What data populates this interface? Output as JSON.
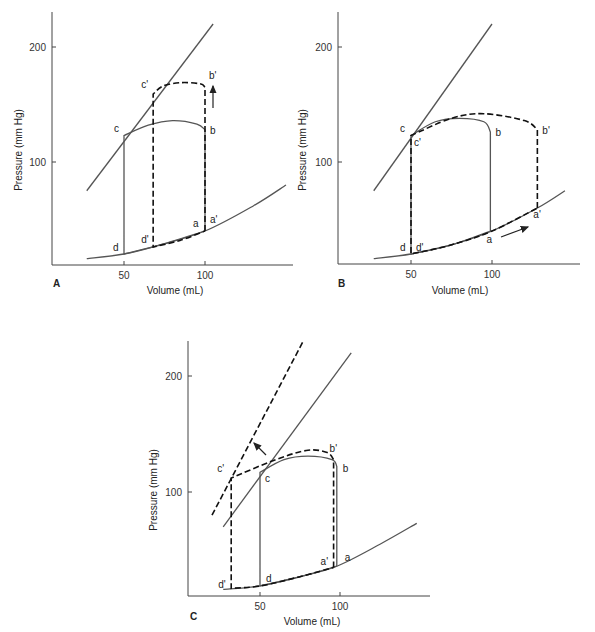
{
  "figure": {
    "x_axis_label": "Volume (mL)",
    "y_axis_label": "Pressure (mm Hg)"
  },
  "chart_data": [
    {
      "type": "line",
      "panel": "A",
      "title": "",
      "xlabel": "Volume (mL)",
      "ylabel": "Pressure (mm Hg)",
      "x_ticks": [
        50,
        100
      ],
      "y_ticks": [
        100,
        200
      ],
      "xlim": [
        10,
        155
      ],
      "ylim": [
        10,
        215
      ],
      "annotation": "upward arrow from b to b' (increased afterload)",
      "series": [
        {
          "name": "ESPVR",
          "style": "solid",
          "points": [
            [
              27,
              75
            ],
            [
              105,
              220
            ]
          ]
        },
        {
          "name": "EDPVR",
          "style": "solid",
          "points": [
            [
              27,
              16
            ],
            [
              50,
              20
            ],
            [
              70,
              27
            ],
            [
              100,
              40
            ],
            [
              130,
              62
            ],
            [
              150,
              80
            ]
          ]
        },
        {
          "name": "Control loop (a-b-c-d)",
          "style": "solid",
          "points": [
            [
              100,
              40
            ],
            [
              100,
              128
            ],
            [
              95,
              133
            ],
            [
              80,
              136
            ],
            [
              65,
              132
            ],
            [
              50,
              123
            ],
            [
              50,
              20
            ],
            [
              70,
              27
            ],
            [
              100,
              40
            ]
          ]
        },
        {
          "name": "Increased afterload loop (a'-b'-c'-d')",
          "style": "dashed",
          "points": [
            [
              100,
              40
            ],
            [
              100,
              165
            ],
            [
              97,
              168
            ],
            [
              85,
              169
            ],
            [
              74,
              166
            ],
            [
              68,
              159
            ],
            [
              68,
              26
            ],
            [
              85,
              32
            ],
            [
              100,
              40
            ]
          ]
        }
      ],
      "point_labels": {
        "a": [
          100,
          40
        ],
        "a'": [
          100,
          40
        ],
        "b": [
          100,
          128
        ],
        "b'": [
          100,
          165
        ],
        "c": [
          50,
          123
        ],
        "c'": [
          68,
          159
        ],
        "d": [
          50,
          20
        ],
        "d'": [
          68,
          26
        ]
      }
    },
    {
      "type": "line",
      "panel": "B",
      "title": "",
      "xlabel": "Volume (mL)",
      "ylabel": "Pressure (mm Hg)",
      "x_ticks": [
        50,
        100
      ],
      "y_ticks": [
        100,
        200
      ],
      "xlim": [
        10,
        155
      ],
      "ylim": [
        10,
        215
      ],
      "annotation": "arrow along EDPVR from a toward a' (increased preload)",
      "series": [
        {
          "name": "ESPVR",
          "style": "solid",
          "points": [
            [
              27,
              75
            ],
            [
              100,
              220
            ]
          ]
        },
        {
          "name": "EDPVR",
          "style": "solid",
          "points": [
            [
              27,
              16
            ],
            [
              50,
              20
            ],
            [
              75,
              28
            ],
            [
              100,
              40
            ],
            [
              128,
              60
            ],
            [
              145,
              75
            ]
          ]
        },
        {
          "name": "Control loop (a-b-c-d)",
          "style": "solid",
          "points": [
            [
              99,
              40
            ],
            [
              99,
              126
            ],
            [
              95,
              135
            ],
            [
              80,
              138
            ],
            [
              65,
              135
            ],
            [
              50,
              123
            ],
            [
              50,
              20
            ],
            [
              75,
              28
            ],
            [
              99,
              40
            ]
          ]
        },
        {
          "name": "Increased preload loop (a'-b'-c'-d')",
          "style": "dashed",
          "points": [
            [
              128,
              60
            ],
            [
              128,
              128
            ],
            [
              120,
              136
            ],
            [
              95,
              142
            ],
            [
              75,
              138
            ],
            [
              50,
              123
            ],
            [
              50,
              20
            ],
            [
              75,
              28
            ],
            [
              100,
              40
            ],
            [
              128,
              60
            ]
          ]
        }
      ],
      "point_labels": {
        "a": [
          99,
          40
        ],
        "a'": [
          128,
          60
        ],
        "b": [
          99,
          126
        ],
        "b'": [
          128,
          128
        ],
        "c": [
          50,
          123
        ],
        "c'": [
          50,
          123
        ],
        "d": [
          50,
          20
        ],
        "d'": [
          50,
          20
        ]
      }
    },
    {
      "type": "line",
      "panel": "C",
      "title": "",
      "xlabel": "Volume (mL)",
      "ylabel": "Pressure (mm Hg)",
      "x_ticks": [
        50,
        100
      ],
      "y_ticks": [
        100,
        200
      ],
      "xlim": [
        5,
        155
      ],
      "ylim": [
        10,
        230
      ],
      "annotation": "arrow pointing up-left from ESPVR to steeper dashed ESPVR (increased contractility)",
      "series": [
        {
          "name": "ESPVR",
          "style": "solid",
          "points": [
            [
              27,
              70
            ],
            [
              107,
              220
            ]
          ]
        },
        {
          "name": "ESPVR (increased contractility)",
          "style": "dashed",
          "points": [
            [
              20,
              80
            ],
            [
              77,
              230
            ]
          ]
        },
        {
          "name": "EDPVR",
          "style": "solid",
          "points": [
            [
              27,
              16
            ],
            [
              50,
              19
            ],
            [
              75,
              27
            ],
            [
              98,
              36
            ],
            [
              125,
              55
            ],
            [
              148,
              73
            ]
          ]
        },
        {
          "name": "Control loop (a-b-c-d)",
          "style": "solid",
          "points": [
            [
              98,
              36
            ],
            [
              98,
              122
            ],
            [
              95,
              128
            ],
            [
              80,
              131
            ],
            [
              65,
              128
            ],
            [
              50,
              117
            ],
            [
              50,
              19
            ],
            [
              75,
              27
            ],
            [
              98,
              36
            ]
          ]
        },
        {
          "name": "Increased contractility loop (a'-b'-c'-d')",
          "style": "dashed",
          "points": [
            [
              96,
              35
            ],
            [
              96,
              128
            ],
            [
              92,
              134
            ],
            [
              80,
              136
            ],
            [
              60,
              128
            ],
            [
              32,
              112
            ],
            [
              32,
              17
            ],
            [
              50,
              19
            ],
            [
              75,
              27
            ],
            [
              96,
              35
            ]
          ]
        }
      ],
      "point_labels": {
        "a": [
          98,
          36
        ],
        "a'": [
          96,
          35
        ],
        "b": [
          98,
          122
        ],
        "b'": [
          96,
          128
        ],
        "c": [
          50,
          117
        ],
        "c'": [
          32,
          112
        ],
        "d": [
          50,
          19
        ],
        "d'": [
          32,
          17
        ]
      }
    }
  ]
}
